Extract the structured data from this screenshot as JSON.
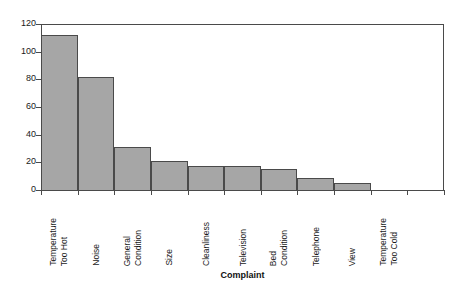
{
  "chart_data": {
    "type": "bar",
    "title": "",
    "xlabel": "Complaint",
    "ylabel": "",
    "ylim": [
      0,
      120
    ],
    "yticks": [
      0,
      20,
      40,
      60,
      80,
      100,
      120
    ],
    "grid": false,
    "legend": null,
    "orientation": "vertical",
    "bar_fill_color": "#a6a6a6",
    "bar_edge_color": "#4a4a4a",
    "categories": [
      "Temperature Too Hot",
      "Noise",
      "General Condition",
      "Size",
      "Cleanliness",
      "Television",
      "Bed Condition",
      "Telephone",
      "View",
      "Temperature Too Cold"
    ],
    "category_lines": [
      [
        "Temperature",
        "Too Hot"
      ],
      [
        "Noise"
      ],
      [
        "General",
        "Condition"
      ],
      [
        "Size"
      ],
      [
        "Cleanliness"
      ],
      [
        "Television"
      ],
      [
        "Bed",
        "Condition"
      ],
      [
        "Telephone"
      ],
      [
        "View"
      ],
      [
        "Temperature",
        "Too Cold"
      ]
    ],
    "values": [
      112,
      82,
      31,
      21,
      17,
      17,
      15,
      9,
      5,
      0
    ]
  },
  "axes": {
    "y_tick_labels": [
      "0",
      "20",
      "40",
      "60",
      "80",
      "100",
      "120"
    ],
    "x_axis_title": "Complaint"
  }
}
